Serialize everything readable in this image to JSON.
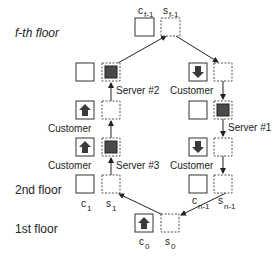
{
  "floors": {
    "top": "f-th floor",
    "second": "2nd floor",
    "first": "1st floor"
  },
  "labels": {
    "c_f1": {
      "base": "c",
      "sub": "f-1"
    },
    "s_f1": {
      "base": "s",
      "sub": "f-1"
    },
    "c_1": {
      "base": "c",
      "sub": "1"
    },
    "s_1": {
      "base": "s",
      "sub": "1"
    },
    "c_n1": {
      "base": "c",
      "sub": "n-1"
    },
    "s_n1": {
      "base": "s",
      "sub": "n-1"
    },
    "c_0": {
      "base": "c",
      "sub": "0"
    },
    "s_0": {
      "base": "s",
      "sub": "0"
    }
  },
  "servers": {
    "s1": "Server #1",
    "s2": "Server #2",
    "s3": "Server #3"
  },
  "customer_label": "Customer",
  "colors": {
    "server_fill": "#4a4a4a",
    "arrow_icon": "#3a3a3a",
    "line": "#222222",
    "dashed": "#555555"
  }
}
